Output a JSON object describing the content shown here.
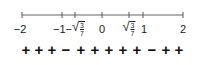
{
  "number_line": {
    "range": [
      -2,
      2
    ],
    "line_color": "#555555",
    "ticks": [
      {
        "value": -2,
        "label": "−2",
        "x": 22
      },
      {
        "value": -1,
        "label": "−1",
        "x": 62
      },
      {
        "value": -0.6547,
        "label": "−√(3/7)",
        "x": 75
      },
      {
        "value": 0,
        "label": "0",
        "x": 102
      },
      {
        "value": 0.6547,
        "label": "√(3/7)",
        "x": 129
      },
      {
        "value": 1,
        "label": "1",
        "x": 143
      },
      {
        "value": 2,
        "label": "2",
        "x": 183
      }
    ],
    "labels": {
      "neg_two": "−2",
      "neg_one_minus": "−1−",
      "zero": "0",
      "one": "1",
      "two": "2",
      "sqrt_num": "3",
      "sqrt_den": "7",
      "radical": "√"
    }
  },
  "sign_row": {
    "signs": [
      "+",
      "+",
      "+",
      "−",
      "+",
      "+",
      "+",
      "+",
      "+",
      "−",
      "+",
      "+",
      "+"
    ]
  }
}
